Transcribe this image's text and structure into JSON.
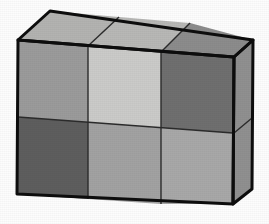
{
  "figure": {
    "shape_kind": "rectangular-block-isometric",
    "rows": 2,
    "columns": 3,
    "depth_units": 1,
    "total_visible_front_cells": 6,
    "background_color": "#fdfdfd",
    "outline_color": "#0d0d0d",
    "outline_width": 3,
    "seam_color": "#2b2b2b",
    "seam_width": 1.4,
    "projection": {
      "type": "oblique",
      "depth_dx": 32,
      "depth_dy": -29
    },
    "front_face": {
      "label": "front-face",
      "corners": [
        [
          18,
          40
        ],
        [
          234,
          57
        ],
        [
          233,
          204
        ],
        [
          17,
          194
        ]
      ],
      "cells": [
        {
          "id": "cell-r1c1",
          "row": 1,
          "col": 1,
          "color": "#9b9b9b",
          "tone": "medium-gray",
          "corners": [
            [
              18,
              40
            ],
            [
              88,
              46
            ],
            [
              88,
              122
            ],
            [
              18,
              117
            ]
          ]
        },
        {
          "id": "cell-r1c2",
          "row": 1,
          "col": 2,
          "color": "#cbcbc9",
          "tone": "light-gray",
          "corners": [
            [
              88,
              46
            ],
            [
              161,
              52
            ],
            [
              161,
              128
            ],
            [
              88,
              122
            ]
          ]
        },
        {
          "id": "cell-r1c3",
          "row": 1,
          "col": 3,
          "color": "#6f6f6f",
          "tone": "dark-gray",
          "corners": [
            [
              161,
              52
            ],
            [
              234,
              57
            ],
            [
              233,
              133
            ],
            [
              161,
              128
            ]
          ]
        },
        {
          "id": "cell-r2c1",
          "row": 2,
          "col": 1,
          "color": "#5e5e5e",
          "tone": "dark-gray",
          "corners": [
            [
              18,
              117
            ],
            [
              88,
              122
            ],
            [
              88,
              199
            ],
            [
              17,
              194
            ]
          ]
        },
        {
          "id": "cell-r2c2",
          "row": 2,
          "col": 2,
          "color": "#a2a2a2",
          "tone": "medium-gray",
          "corners": [
            [
              88,
              122
            ],
            [
              161,
              128
            ],
            [
              161,
              204
            ],
            [
              88,
              199
            ]
          ]
        },
        {
          "id": "cell-r2c3",
          "row": 2,
          "col": 3,
          "color": "#a8a8a8",
          "tone": "medium-light-gray",
          "corners": [
            [
              161,
              128
            ],
            [
              233,
              133
            ],
            [
              233,
              204
            ],
            [
              161,
              204
            ]
          ]
        }
      ]
    },
    "top_face": {
      "label": "top-face",
      "corners": [
        [
          18,
          40
        ],
        [
          50,
          11
        ],
        [
          253,
          40
        ],
        [
          234,
          57
        ]
      ],
      "cells": [
        {
          "id": "top-c1",
          "col": 1,
          "color": "#b3b3b1",
          "tone": "light-medium-gray",
          "corners": [
            [
              18,
              40
            ],
            [
              50,
              11
            ],
            [
              119,
              17
            ],
            [
              88,
              46
            ]
          ]
        },
        {
          "id": "top-c2",
          "col": 2,
          "color": "#b8b8b6",
          "tone": "light-medium-gray",
          "corners": [
            [
              88,
              46
            ],
            [
              119,
              17
            ],
            [
              190,
              23
            ],
            [
              161,
              52
            ]
          ]
        },
        {
          "id": "top-c3",
          "col": 3,
          "color": "#8c8c8c",
          "tone": "medium-dark-gray",
          "corners": [
            [
              161,
              52
            ],
            [
              190,
              23
            ],
            [
              253,
              40
            ],
            [
              234,
              57
            ]
          ]
        }
      ]
    },
    "right_face": {
      "label": "right-side-face",
      "color": "#909090",
      "tone": "medium-gray",
      "corners": [
        [
          234,
          57
        ],
        [
          253,
          40
        ],
        [
          252,
          189
        ],
        [
          233,
          204
        ]
      ],
      "seam": {
        "from": [
          234,
          133
        ],
        "to": [
          252,
          118
        ]
      }
    },
    "seams": [
      {
        "id": "seam-vertical-1",
        "from": [
          88,
          46
        ],
        "to": [
          88,
          199
        ]
      },
      {
        "id": "seam-vertical-2",
        "from": [
          161,
          52
        ],
        "to": [
          161,
          204
        ]
      },
      {
        "id": "seam-horizontal-1",
        "from": [
          18,
          117
        ],
        "to": [
          233,
          133
        ]
      },
      {
        "id": "seam-top-1",
        "from": [
          119,
          17
        ],
        "to": [
          88,
          46
        ]
      },
      {
        "id": "seam-top-2",
        "from": [
          190,
          23
        ],
        "to": [
          161,
          52
        ]
      }
    ]
  }
}
